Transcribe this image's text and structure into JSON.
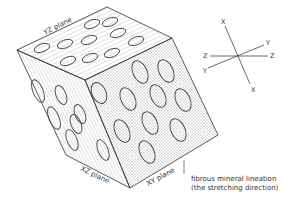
{
  "diagram": {
    "planes": {
      "yz": "YZ plane",
      "xz": "XZ plane",
      "xy": "XY plane"
    },
    "annotation": {
      "line1": "fibrous mineral lineation",
      "line2": "(the stretching direction)"
    },
    "axes": {
      "x_top": "X",
      "x_bottom": "X",
      "z_left": "Z",
      "z_right": "Z",
      "y_left": "Y",
      "y_right": "Y"
    },
    "colors": {
      "outline": "#333333",
      "hatch": "#888888",
      "background": "#ffffff"
    }
  }
}
